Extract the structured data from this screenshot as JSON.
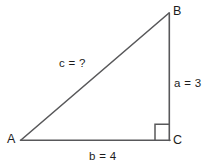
{
  "figure": {
    "type": "right-triangle-diagram",
    "background_color": "#ffffff",
    "stroke_color": "#58585a",
    "text_color": "#1c1c1c",
    "width": 214,
    "height": 168
  },
  "vertices": {
    "a": {
      "label": "A",
      "x": 21,
      "y": 140
    },
    "b": {
      "label": "B",
      "x": 169,
      "y": 13
    },
    "c": {
      "label": "C",
      "x": 169,
      "y": 140
    }
  },
  "sides": {
    "hypotenuse": {
      "name": "c",
      "label": "c = ?",
      "value": "?",
      "from": "A",
      "to": "B"
    },
    "vertical": {
      "name": "a",
      "label": "a = 3",
      "value": "3",
      "from": "B",
      "to": "C"
    },
    "horizontal": {
      "name": "b",
      "label": "b = 4",
      "value": "4",
      "from": "A",
      "to": "C"
    }
  },
  "right_angle_marker": {
    "name": "right-angle-square",
    "at_vertex": "C",
    "x": 155,
    "y": 124,
    "size": 16
  }
}
